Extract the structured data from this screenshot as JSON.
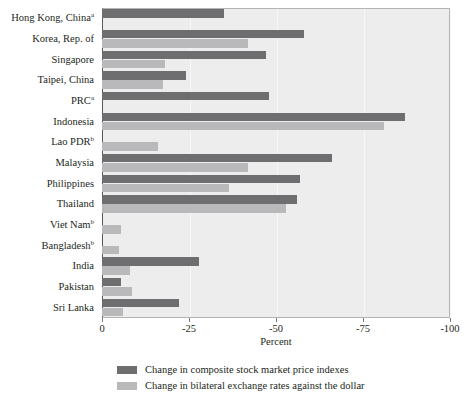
{
  "chart_data": {
    "type": "bar",
    "orientation": "horizontal",
    "title": "",
    "title_fragment_top": "",
    "xlabel": "Percent",
    "ylabel": "",
    "xlim": [
      0,
      -100
    ],
    "xticks": [
      0,
      -25,
      -50,
      -75,
      -100
    ],
    "xtick_labels": [
      "0",
      "-25",
      "-50",
      "-75",
      "-100"
    ],
    "grid": true,
    "legend_position": "bottom-left",
    "categories": [
      "Hong Kong, China",
      "Korea, Rep. of",
      "Singapore",
      "Taipei, China",
      "PRC",
      "Indonesia",
      "Lao PDR",
      "Malaysia",
      "Philippines",
      "Thailand",
      "Viet Nam",
      "Bangladesh",
      "India",
      "Pakistan",
      "Sri Lanka"
    ],
    "category_footnotes": [
      "a",
      "",
      "",
      "",
      "a",
      "",
      "b",
      "",
      "",
      "",
      "b",
      "b",
      "",
      "",
      ""
    ],
    "series": [
      {
        "name": "Change in composite stock market price indexes",
        "color": "#6e6e70",
        "values": [
          -35,
          -58,
          -47,
          -24,
          -48,
          -87,
          0,
          -66,
          -57,
          -56,
          0,
          0,
          -28,
          -5.5,
          -22
        ]
      },
      {
        "name": "Change in bilateral exchange rates against the dollar",
        "color": "#b9b9bb",
        "values": [
          0,
          -42,
          -18,
          -17.5,
          0,
          -81,
          -16,
          -42,
          -36.5,
          -53,
          -5.5,
          -5,
          -8,
          -8.5,
          -6
        ]
      }
    ]
  },
  "legend": {
    "items": [
      {
        "label": "Change in composite stock market price indexes",
        "color": "#6e6e70"
      },
      {
        "label": "Change in bilateral exchange rates against the dollar",
        "color": "#b9b9bb"
      }
    ]
  },
  "axis": {
    "x_title": "Percent"
  }
}
